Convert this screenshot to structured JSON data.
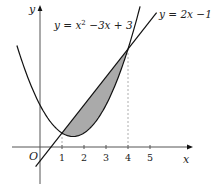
{
  "diagram": {
    "curve_label": "y = x² −3x + 3",
    "curve_label_parts": {
      "pre": "y = x",
      "sup": "2",
      "post": " −3x + 3"
    },
    "line_label": "y = 2x −1",
    "axis_x_label": "x",
    "axis_y_label": "y",
    "origin_label": "O",
    "x_ticks": [
      "1",
      "2",
      "3",
      "4",
      "5"
    ],
    "intersections": [
      [
        1,
        1
      ],
      [
        4,
        7
      ]
    ],
    "shaded_region": "between y = 2x − 1 and y = x² − 3x + 3 for 1 ≤ x ≤ 4",
    "colors": {
      "shade": "#aaaaaa",
      "curve": "#111111",
      "dashed": "#999999"
    }
  }
}
